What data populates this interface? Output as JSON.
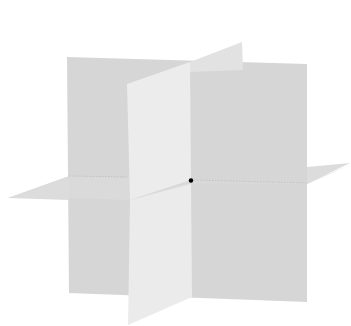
{
  "diagram": {
    "type": "three-coordinate-planes",
    "planes": [
      {
        "name": "back-vertical-plane",
        "fill": "#d6d6d6"
      },
      {
        "name": "horizontal-plane",
        "fill": "#d9d9d9"
      },
      {
        "name": "front-vertical-plane",
        "fill": "#ececec"
      }
    ],
    "origin_point": {
      "x": 191,
      "y": 180,
      "color": "#000000"
    }
  }
}
